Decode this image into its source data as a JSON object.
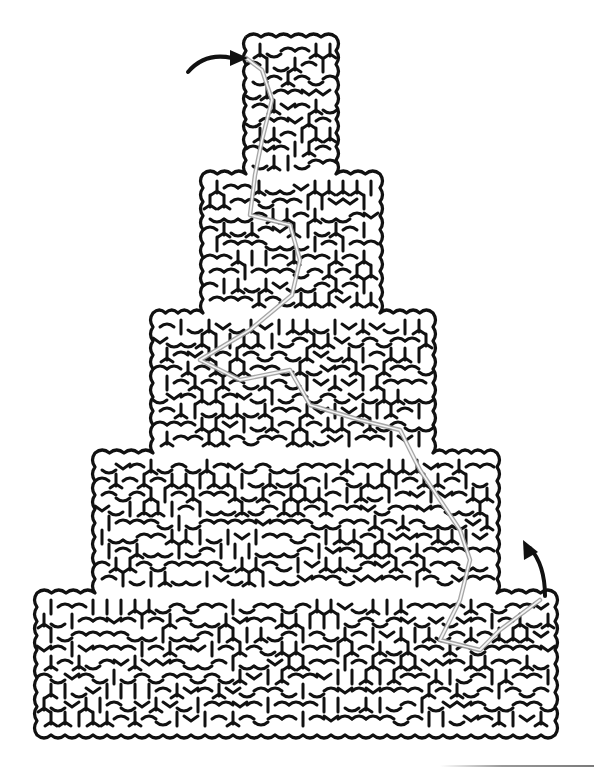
{
  "puzzle": {
    "type": "maze",
    "shape": "stepped-pyramid",
    "tiers": [
      {
        "x": 246,
        "y": 37,
        "w": 90,
        "h": 137
      },
      {
        "x": 203,
        "y": 174,
        "w": 177,
        "h": 139
      },
      {
        "x": 153,
        "y": 313,
        "w": 280,
        "h": 140
      },
      {
        "x": 95,
        "y": 453,
        "w": 402,
        "h": 140
      },
      {
        "x": 37,
        "y": 593,
        "w": 518,
        "h": 142
      }
    ],
    "entry_arrow": {
      "label": "start",
      "from": [
        190,
        68
      ],
      "to": [
        246,
        58
      ]
    },
    "exit_arrow": {
      "label": "finish",
      "from": [
        545,
        595
      ],
      "to": [
        525,
        540
      ]
    },
    "solution_path": [
      [
        246,
        58
      ],
      [
        262,
        70
      ],
      [
        272,
        100
      ],
      [
        262,
        140
      ],
      [
        255,
        175
      ],
      [
        250,
        215
      ],
      [
        290,
        225
      ],
      [
        300,
        260
      ],
      [
        292,
        295
      ],
      [
        250,
        330
      ],
      [
        200,
        360
      ],
      [
        240,
        380
      ],
      [
        290,
        370
      ],
      [
        310,
        405
      ],
      [
        360,
        420
      ],
      [
        400,
        430
      ],
      [
        420,
        470
      ],
      [
        440,
        500
      ],
      [
        460,
        530
      ],
      [
        470,
        560
      ],
      [
        460,
        600
      ],
      [
        440,
        640
      ],
      [
        480,
        650
      ],
      [
        500,
        630
      ],
      [
        540,
        600
      ]
    ],
    "colors": {
      "wall": "#111111",
      "solution": "#9c9c9c",
      "background": "#ffffff"
    }
  }
}
